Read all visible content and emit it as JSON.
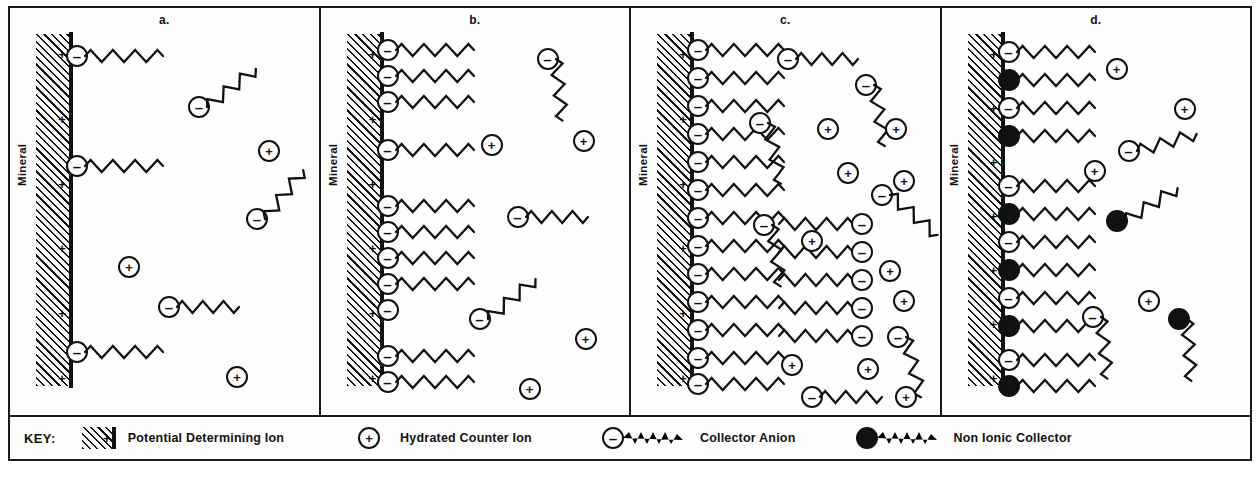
{
  "figure": {
    "type": "diagram",
    "mineral_label": "Mineral",
    "surface_charge_symbol": "+",
    "symbols": {
      "negative": "–",
      "positive": "+"
    }
  },
  "panels": [
    {
      "label": "a.",
      "description": "Sparse collector anion adsorption, individual ions at surface",
      "surface_plus_count": 6,
      "adsorbed": [
        {
          "kind": "collector-anion",
          "y": 48,
          "tail": true
        },
        {
          "kind": "collector-anion",
          "y": 158,
          "tail": true
        },
        {
          "kind": "collector-anion",
          "y": 344,
          "tail": true
        }
      ],
      "solution": [
        {
          "kind": "collector-anion",
          "x": 178,
          "y": 88,
          "rot": -38
        },
        {
          "kind": "hydrated-counter-ion",
          "x": 248,
          "y": 132
        },
        {
          "kind": "hydrated-counter-ion",
          "x": 108,
          "y": 248
        },
        {
          "kind": "collector-anion",
          "x": 236,
          "y": 200,
          "rot": -52
        },
        {
          "kind": "collector-anion",
          "x": 148,
          "y": 288,
          "rot": 0
        },
        {
          "kind": "hydrated-counter-ion",
          "x": 216,
          "y": 358
        }
      ]
    },
    {
      "label": "b.",
      "description": "Increased collector anion adsorption forming patches along the surface",
      "surface_plus_count": 6,
      "adsorbed": [
        {
          "kind": "collector-anion",
          "y": 42,
          "tail": true
        },
        {
          "kind": "collector-anion",
          "y": 68,
          "tail": true
        },
        {
          "kind": "collector-anion",
          "y": 94,
          "tail": true
        },
        {
          "kind": "collector-anion",
          "y": 142,
          "tail": true
        },
        {
          "kind": "collector-anion",
          "y": 198,
          "tail": true
        },
        {
          "kind": "collector-anion",
          "y": 224,
          "tail": true
        },
        {
          "kind": "collector-anion",
          "y": 250,
          "tail": true
        },
        {
          "kind": "collector-anion",
          "y": 276,
          "tail": true
        },
        {
          "kind": "collector-anion",
          "y": 302,
          "tail": false
        },
        {
          "kind": "collector-anion",
          "y": 348,
          "tail": true
        },
        {
          "kind": "collector-anion",
          "y": 374,
          "tail": true
        }
      ],
      "solution": [
        {
          "kind": "collector-anion",
          "x": 216,
          "y": 40,
          "rot": 84
        },
        {
          "kind": "hydrated-counter-ion",
          "x": 160,
          "y": 126
        },
        {
          "kind": "hydrated-counter-ion",
          "x": 252,
          "y": 122
        },
        {
          "kind": "collector-anion",
          "x": 186,
          "y": 198,
          "rot": 0
        },
        {
          "kind": "collector-anion",
          "x": 148,
          "y": 300,
          "rot": -40
        },
        {
          "kind": "hydrated-counter-ion",
          "x": 254,
          "y": 320
        },
        {
          "kind": "hydrated-counter-ion",
          "x": 198,
          "y": 370
        }
      ]
    },
    {
      "label": "c.",
      "description": "Complete monolayer plus reverse-oriented second layer (hemimicelle / bilayer), excess counter ions in solution",
      "surface_plus_count": 6,
      "adsorbed": [
        {
          "kind": "collector-anion",
          "y": 42,
          "tail": true
        },
        {
          "kind": "collector-anion",
          "y": 70,
          "tail": true
        },
        {
          "kind": "collector-anion",
          "y": 98,
          "tail": true
        },
        {
          "kind": "collector-anion",
          "y": 126,
          "tail": true
        },
        {
          "kind": "collector-anion",
          "y": 154,
          "tail": true
        },
        {
          "kind": "collector-anion",
          "y": 182,
          "tail": true
        },
        {
          "kind": "collector-anion",
          "y": 210,
          "tail": true
        },
        {
          "kind": "collector-anion",
          "y": 238,
          "tail": true
        },
        {
          "kind": "collector-anion",
          "y": 266,
          "tail": true
        },
        {
          "kind": "collector-anion",
          "y": 294,
          "tail": true
        },
        {
          "kind": "collector-anion",
          "y": 322,
          "tail": true
        },
        {
          "kind": "collector-anion",
          "y": 350,
          "tail": true
        },
        {
          "kind": "collector-anion",
          "y": 376,
          "tail": true
        }
      ],
      "second_layer": [
        {
          "kind": "collector-anion-reversed",
          "y": 216
        },
        {
          "kind": "collector-anion-reversed",
          "y": 244
        },
        {
          "kind": "collector-anion-reversed",
          "y": 272
        },
        {
          "kind": "collector-anion-reversed",
          "y": 300
        },
        {
          "kind": "collector-anion-reversed",
          "y": 328
        }
      ],
      "solution": [
        {
          "kind": "collector-anion",
          "x": 146,
          "y": 40,
          "rot": 0
        },
        {
          "kind": "collector-anion",
          "x": 224,
          "y": 66,
          "rot": 80
        },
        {
          "kind": "collector-anion",
          "x": 118,
          "y": 104,
          "rot": 78
        },
        {
          "kind": "hydrated-counter-ion",
          "x": 186,
          "y": 110
        },
        {
          "kind": "hydrated-counter-ion",
          "x": 254,
          "y": 110
        },
        {
          "kind": "hydrated-counter-ion",
          "x": 206,
          "y": 154
        },
        {
          "kind": "collector-anion",
          "x": 240,
          "y": 176,
          "rot": 40
        },
        {
          "kind": "hydrated-counter-ion",
          "x": 262,
          "y": 162
        },
        {
          "kind": "collector-anion",
          "x": 122,
          "y": 206,
          "rot": 82
        },
        {
          "kind": "hydrated-counter-ion",
          "x": 170,
          "y": 222
        },
        {
          "kind": "hydrated-counter-ion",
          "x": 248,
          "y": 252
        },
        {
          "kind": "hydrated-counter-ion",
          "x": 262,
          "y": 282
        },
        {
          "kind": "collector-anion",
          "x": 256,
          "y": 318,
          "rot": 76
        },
        {
          "kind": "hydrated-counter-ion",
          "x": 226,
          "y": 350
        },
        {
          "kind": "hydrated-counter-ion",
          "x": 150,
          "y": 346
        },
        {
          "kind": "hydrated-counter-ion",
          "x": 264,
          "y": 378
        },
        {
          "kind": "collector-anion",
          "x": 170,
          "y": 378,
          "rot": 0
        }
      ]
    },
    {
      "label": "d.",
      "description": "Mixed adsorbed layer of collector anions alternating with non-ionic collector molecules",
      "surface_plus_count": 7,
      "adsorbed": [
        {
          "kind": "collector-anion",
          "y": 44,
          "tail": true
        },
        {
          "kind": "non-ionic-collector",
          "y": 72,
          "tail": true
        },
        {
          "kind": "collector-anion",
          "y": 100,
          "tail": true
        },
        {
          "kind": "non-ionic-collector",
          "y": 128,
          "tail": true
        },
        {
          "kind": "collector-anion",
          "y": 178,
          "tail": true
        },
        {
          "kind": "non-ionic-collector",
          "y": 206,
          "tail": true
        },
        {
          "kind": "collector-anion",
          "y": 234,
          "tail": true
        },
        {
          "kind": "non-ionic-collector",
          "y": 262,
          "tail": true
        },
        {
          "kind": "collector-anion",
          "y": 290,
          "tail": true
        },
        {
          "kind": "non-ionic-collector",
          "y": 318,
          "tail": true
        },
        {
          "kind": "collector-anion",
          "y": 352,
          "tail": true
        },
        {
          "kind": "non-ionic-collector",
          "y": 378,
          "tail": true
        }
      ],
      "solution": [
        {
          "kind": "hydrated-counter-ion",
          "x": 164,
          "y": 50
        },
        {
          "kind": "hydrated-counter-ion",
          "x": 232,
          "y": 90
        },
        {
          "kind": "collector-anion",
          "x": 176,
          "y": 132,
          "rot": -16
        },
        {
          "kind": "hydrated-counter-ion",
          "x": 142,
          "y": 152
        },
        {
          "kind": "non-ionic-collector",
          "x": 164,
          "y": 202,
          "rot": -32
        },
        {
          "kind": "hydrated-counter-ion",
          "x": 196,
          "y": 282
        },
        {
          "kind": "collector-anion",
          "x": 140,
          "y": 298,
          "rot": 84
        },
        {
          "kind": "non-ionic-collector",
          "x": 226,
          "y": 300,
          "rot": 86
        }
      ]
    }
  ],
  "key": {
    "title": "KEY:",
    "items": [
      {
        "symbol": "hatched-plus-swatch",
        "label": "Potential Determining Ion"
      },
      {
        "symbol": "open-circle-plus",
        "label": "Hydrated Counter Ion"
      },
      {
        "symbol": "open-circle-minus-tail",
        "label": "Collector Anion"
      },
      {
        "symbol": "filled-circle-tail",
        "label": "Non Ionic Collector"
      }
    ]
  },
  "colors": {
    "ink": "#111111",
    "background": "#ffffff",
    "border": "#1a1a1a"
  }
}
